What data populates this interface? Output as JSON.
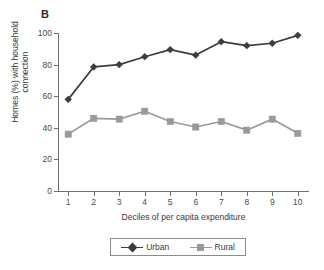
{
  "figure": {
    "panel_label": "B"
  },
  "chart_data": {
    "type": "line",
    "title": "B",
    "xlabel": "Deciles of per capita expenditure",
    "ylabel": "Homes (%) with household connection",
    "ylabel_line1": "Homes (%) with household",
    "ylabel_line2": "connection",
    "categories": [
      "1",
      "2",
      "3",
      "4",
      "5",
      "6",
      "7",
      "8",
      "9",
      "10"
    ],
    "x": [
      1,
      2,
      3,
      4,
      5,
      6,
      7,
      8,
      9,
      10
    ],
    "xlim": [
      0.6,
      10.4
    ],
    "ylim": [
      0,
      100
    ],
    "yticks": [
      0,
      20,
      40,
      60,
      80,
      100
    ],
    "ytick_labels": [
      "0",
      "20",
      "40",
      "60",
      "80",
      "100"
    ],
    "xticks": [
      1,
      2,
      3,
      4,
      5,
      6,
      7,
      8,
      9,
      10
    ],
    "grid": false,
    "legend_position": "bottom",
    "series": [
      {
        "name": "Urban",
        "color": "#3d3d3d",
        "marker": "diamond",
        "values": [
          58,
          78.5,
          80,
          85,
          89.5,
          86,
          94.5,
          92,
          93.5,
          98.5
        ]
      },
      {
        "name": "Rural",
        "color": "#9a9a9a",
        "marker": "square",
        "values": [
          36,
          46,
          45.5,
          50.5,
          44,
          40.5,
          44,
          38.5,
          45.5,
          36.5
        ]
      }
    ]
  },
  "legend": {
    "entries": [
      {
        "label": "Urban",
        "color": "#3d3d3d",
        "marker": "diamond"
      },
      {
        "label": "Rural",
        "color": "#9a9a9a",
        "marker": "square"
      }
    ]
  },
  "colors": {
    "urban": "#3d3d3d",
    "rural": "#9a9a9a",
    "axis": "#6f6f6f",
    "text": "#3a3a3a",
    "background": "#ffffff"
  }
}
